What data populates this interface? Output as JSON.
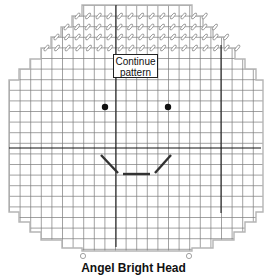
{
  "title": "Angel Bright Head",
  "callout": {
    "line1": "Continue",
    "line2": "pattern"
  },
  "colors": {
    "grid": "#7a7a7a",
    "outline": "#b5b5b5",
    "center_lines": "#111111",
    "stitch_marks": "#888888",
    "features": "#333333"
  },
  "pattern": {
    "grid_pitch_px": 10.6,
    "features": {
      "eyes": [
        {
          "x": 105,
          "y": 107
        },
        {
          "x": 168,
          "y": 107
        }
      ],
      "mouth": [
        {
          "x1": 101,
          "y1": 155,
          "x2": 118,
          "y2": 173
        },
        {
          "x1": 123,
          "y1": 174,
          "x2": 150,
          "y2": 174
        },
        {
          "x1": 155,
          "y1": 173,
          "x2": 171,
          "y2": 155
        }
      ]
    },
    "markers": [
      {
        "x": 83,
        "y": 256
      },
      {
        "x": 189,
        "y": 256
      }
    ]
  }
}
